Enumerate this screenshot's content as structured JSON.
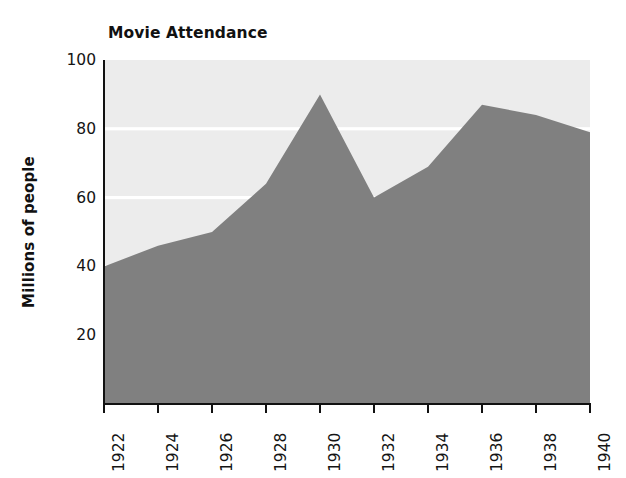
{
  "chart_data": {
    "type": "area",
    "title": "Movie Attendance",
    "xlabel": "",
    "ylabel": "Millions of people",
    "categories": [
      "1922",
      "1924",
      "1926",
      "1928",
      "1930",
      "1932",
      "1934",
      "1936",
      "1938",
      "1940"
    ],
    "x": [
      1922,
      1924,
      1926,
      1928,
      1930,
      1932,
      1934,
      1936,
      1938,
      1940
    ],
    "values": [
      40,
      46,
      50,
      64,
      90,
      60,
      69,
      87,
      84,
      79
    ],
    "ylim": [
      0,
      100
    ],
    "xlim": [
      1922,
      1940
    ],
    "yticks": [
      20,
      40,
      60,
      80,
      100
    ],
    "ytick_labels": [
      "20",
      "40",
      "60",
      "80",
      "100"
    ],
    "grid": "horizontal-white-gridlines",
    "legend": "none",
    "series": [
      {
        "name": "Movie Attendance",
        "values": [
          40,
          46,
          50,
          64,
          90,
          60,
          69,
          87,
          84,
          79
        ]
      }
    ]
  },
  "style": {
    "area_fill": "#808080",
    "plot_background": "#ececec",
    "gridline_color": "#ffffff",
    "axis_color": "#111111",
    "text_color": "#141414"
  }
}
